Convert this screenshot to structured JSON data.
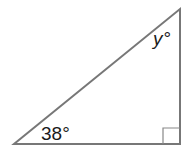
{
  "diagram": {
    "type": "right-triangle",
    "angles": {
      "bottom_left": "38°",
      "top": "y°",
      "bottom_right": "right angle"
    },
    "labels": {
      "angle_a": "38°",
      "angle_y_var": "y",
      "angle_y_deg": "°"
    },
    "colors": {
      "stroke": "#777777",
      "text": "#1a1a1a"
    }
  }
}
